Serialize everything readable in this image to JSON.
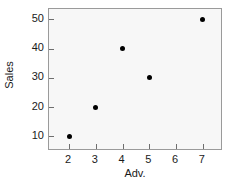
{
  "figure": {
    "background_color": "#ffffff",
    "plot_background_color": "#f7f7f7",
    "frame_color": "#9a9a9a",
    "point_color": "#000000",
    "cropped_title_fragment": ""
  },
  "chart_data": {
    "type": "scatter",
    "title": "",
    "xlabel": "Adv.",
    "ylabel": "Sales",
    "xlim": [
      1.25,
      7.75
    ],
    "ylim": [
      5.0,
      53.5
    ],
    "xticks": [
      2,
      3,
      4,
      5,
      6,
      7
    ],
    "xtick_labels": [
      "2",
      "3",
      "4",
      "5",
      "6",
      "7"
    ],
    "yticks": [
      10,
      20,
      30,
      40,
      50
    ],
    "ytick_labels": [
      "10",
      "20",
      "30",
      "40",
      "50"
    ],
    "grid": false,
    "legend": null,
    "x": [
      2,
      3,
      4,
      5,
      7
    ],
    "y": [
      10,
      20,
      40,
      30,
      50
    ],
    "points": [
      {
        "x": 2,
        "y": 10
      },
      {
        "x": 3,
        "y": 20
      },
      {
        "x": 4,
        "y": 40
      },
      {
        "x": 5,
        "y": 30
      },
      {
        "x": 7,
        "y": 50
      }
    ],
    "marker": "filled-circle"
  }
}
